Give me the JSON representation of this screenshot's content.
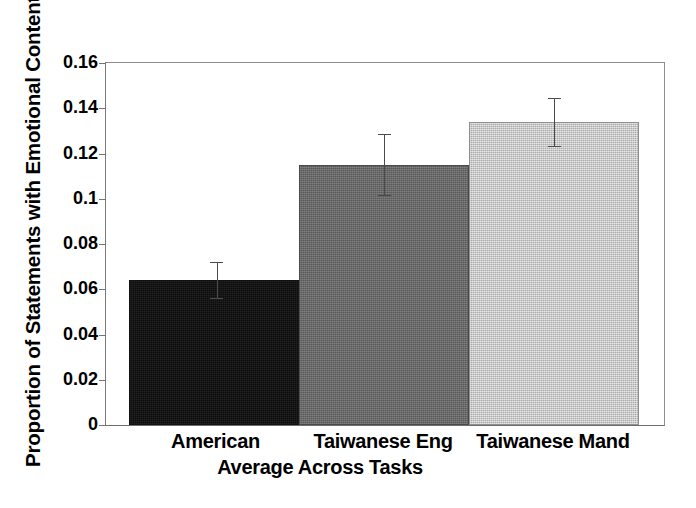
{
  "chart_data": {
    "type": "bar",
    "title": "",
    "xlabel": "Average Across Tasks",
    "ylabel": "Proportion of Statements with Emotional Content",
    "categories": [
      "American",
      "Taiwanese Eng",
      "Taiwanese Mand"
    ],
    "values": [
      0.064,
      0.115,
      0.134
    ],
    "errors": [
      0.008,
      0.0135,
      0.0105
    ],
    "error_type": "symmetric",
    "ylim": [
      0,
      0.16
    ],
    "yticks": [
      0,
      0.02,
      0.04,
      0.06,
      0.08,
      0.1,
      0.12,
      0.14,
      0.16
    ],
    "ytick_labels": [
      "0",
      "0.02",
      "0.04",
      "0.06",
      "0.08",
      "0.1",
      "0.12",
      "0.14",
      "0.16"
    ],
    "grid": false,
    "legend": false,
    "legend_position": "none",
    "bar_colors": [
      "#0d0d0d",
      "#636363",
      "#c6c6c6"
    ],
    "error_bar_color": "#4a4a4a",
    "axis_color": "#7a7a7a",
    "background_color": "#ffffff",
    "series": [
      {
        "name": "Proportion of Statements with Emotional Content",
        "points": [
          {
            "category": "American",
            "value": 0.064,
            "error": 0.008,
            "color": "#0d0d0d"
          },
          {
            "category": "Taiwanese Eng",
            "value": 0.115,
            "error": 0.0135,
            "color": "#636363"
          },
          {
            "category": "Taiwanese Mand",
            "value": 0.134,
            "error": 0.0105,
            "color": "#c6c6c6"
          }
        ]
      }
    ]
  }
}
